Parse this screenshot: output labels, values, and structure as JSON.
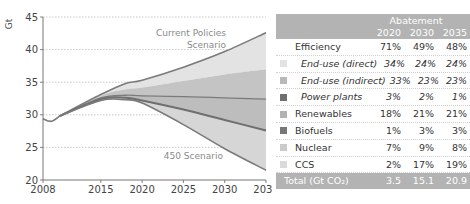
{
  "chart_data": {
    "type": "area",
    "ylabel": "Gt",
    "xlabel": "",
    "ylim": [
      20,
      45
    ],
    "xlim": [
      2008,
      2035
    ],
    "yticks": [
      20,
      25,
      30,
      35,
      40,
      45
    ],
    "xticks": [
      2008,
      2015,
      2020,
      2025,
      2030,
      2035
    ],
    "grid": "horizontal-dotted",
    "annotations": [
      {
        "text": "Current Policies",
        "line2": "Scenario",
        "near": "top-line"
      },
      {
        "text": "450 Scenario",
        "near": "bottom-line"
      }
    ],
    "history": {
      "x": [
        2008,
        2009,
        2010
      ],
      "y": [
        29.4,
        29.0,
        29.8
      ]
    },
    "boundaries": {
      "x": [
        2010,
        2015,
        2018,
        2020,
        2025,
        2030,
        2035
      ],
      "current_policies": [
        29.8,
        33.1,
        34.8,
        35.3,
        37.3,
        39.7,
        42.6
      ],
      "after_end_use_direct": [
        29.8,
        32.9,
        33.9,
        34.2,
        35.2,
        36.2,
        37.0
      ],
      "after_end_use_indirect": [
        29.8,
        32.6,
        33.0,
        32.9,
        32.8,
        32.6,
        32.4
      ],
      "after_power_plants_renewables": [
        29.8,
        32.4,
        32.6,
        32.2,
        30.8,
        29.2,
        27.6
      ],
      "scenario_450": [
        29.8,
        32.2,
        32.3,
        31.8,
        28.5,
        24.8,
        21.5
      ]
    },
    "series_colors": {
      "current_policies_line": "#7a7a7a",
      "band1": "#e3e3e3",
      "band2": "#c4c4c4",
      "band3": "#bdbdbd",
      "band4": "#d6d6d6",
      "mid_line": "#7a7a7a",
      "low_line": "#7a7a7a"
    }
  },
  "table": {
    "header_title": "Abatement",
    "years": [
      "2020",
      "2030",
      "2035"
    ],
    "rows": [
      {
        "label": "Efficiency",
        "values": [
          "71%",
          "49%",
          "48%"
        ],
        "indent": false,
        "swatch": null
      },
      {
        "label": "End-use (direct)",
        "values": [
          "34%",
          "24%",
          "24%"
        ],
        "indent": true,
        "swatch": "#e2e2e2"
      },
      {
        "label": "End-use (indirect)",
        "values": [
          "33%",
          "23%",
          "23%"
        ],
        "indent": true,
        "swatch": "#b9b9b9"
      },
      {
        "label": "Power plants",
        "values": [
          "3%",
          "2%",
          "1%"
        ],
        "indent": true,
        "swatch": "#6f6f6f"
      },
      {
        "label": "Renewables",
        "values": [
          "18%",
          "21%",
          "21%"
        ],
        "indent": false,
        "swatch": "#b2b2b2"
      },
      {
        "label": "Biofuels",
        "values": [
          "1%",
          "3%",
          "3%"
        ],
        "indent": false,
        "swatch": "#777777"
      },
      {
        "label": "Nuclear",
        "values": [
          "7%",
          "9%",
          "8%"
        ],
        "indent": false,
        "swatch": "#cacaca"
      },
      {
        "label": "CCS",
        "values": [
          "2%",
          "17%",
          "19%"
        ],
        "indent": false,
        "swatch": "#dadada"
      }
    ],
    "total": {
      "label": "Total (Gt CO₂)",
      "values": [
        "3.5",
        "15.1",
        "20.9"
      ]
    }
  }
}
